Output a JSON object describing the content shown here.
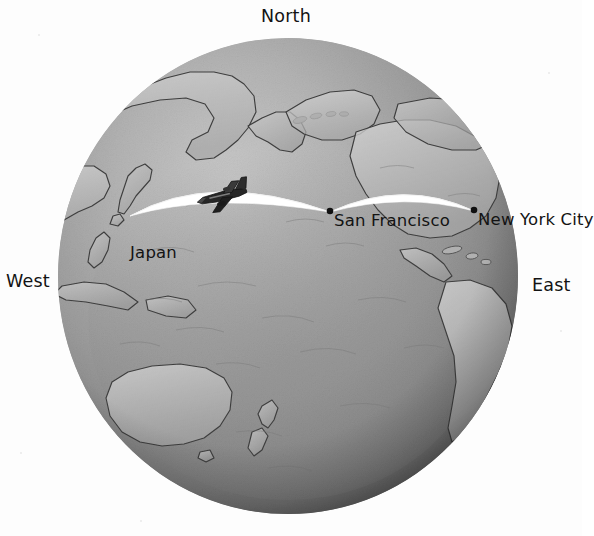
{
  "scene": {
    "title": "Great circle flight routes on a Pacific-centered globe",
    "background_color": "#ffffff",
    "globe": {
      "name": "earth-globe",
      "projection": "orthographic",
      "center_view": "Pacific Ocean",
      "center_x": 288,
      "center_y": 276,
      "radius_x": 230,
      "radius_y": 238,
      "fill_light": "#b9b9b9",
      "fill_dark": "#5a5a5a",
      "outline_color": "#3c3c3c"
    }
  },
  "compass": {
    "north": "North",
    "west": "West",
    "east": "East"
  },
  "route": {
    "path_color": "#ffffff",
    "marker_color": "#101010",
    "aircraft_icon": "airplane-icon",
    "aircraft_heading": "west",
    "stops": [
      {
        "id": "japan",
        "label": "Japan",
        "x": 130,
        "y": 215
      },
      {
        "id": "san-francisco",
        "label": "San Francisco",
        "x": 330,
        "y": 211
      },
      {
        "id": "new-york-city",
        "label": "New York City",
        "x": 474,
        "y": 210
      }
    ],
    "segments": [
      {
        "from": "japan",
        "to": "san-francisco",
        "peak_x": 245,
        "peak_y": 192
      },
      {
        "from": "san-francisco",
        "to": "new-york-city",
        "peak_x": 404,
        "peak_y": 193
      }
    ]
  },
  "landmasses": [
    "Asia",
    "Japan",
    "Indonesia",
    "Australia",
    "New Zealand",
    "Alaska",
    "North America",
    "Central America",
    "South America"
  ]
}
